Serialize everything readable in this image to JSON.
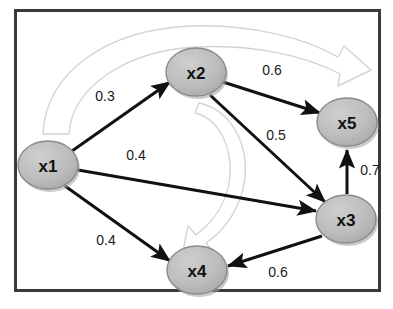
{
  "figure": {
    "type": "directed-weighted-graph",
    "background_color": "#ffffff",
    "border": {
      "color": "#3a3a3a",
      "x": 14,
      "y": 9,
      "width": 367,
      "height": 283,
      "stroke_width": 3
    }
  },
  "style": {
    "node_fill": "#b6b6b6",
    "node_stroke": "#8a8a8a",
    "node_shadow": "#9a9a9a",
    "node_text_color": "#111111",
    "edge_color": "#111111",
    "weight_text_color": "#1a1a1a",
    "decor_arrow_stroke": "#d2d2d2",
    "decor_arrow_fill": "#ffffff"
  },
  "nodes": [
    {
      "id": "x1",
      "label": "x1",
      "cx": 48,
      "cy": 165,
      "rx": 30,
      "ry": 24
    },
    {
      "id": "x2",
      "label": "x2",
      "cx": 196,
      "cy": 72,
      "rx": 30,
      "ry": 24
    },
    {
      "id": "x3",
      "label": "x3",
      "cx": 346,
      "cy": 219,
      "rx": 30,
      "ry": 24
    },
    {
      "id": "x4",
      "label": "x4",
      "cx": 197,
      "cy": 270,
      "rx": 30,
      "ry": 24
    },
    {
      "id": "x5",
      "label": "x5",
      "cx": 347,
      "cy": 122,
      "rx": 30,
      "ry": 24
    }
  ],
  "edges": [
    {
      "id": "e-x1-x2",
      "from": "x1",
      "to": "x2",
      "weight": "0.3",
      "x1": 72,
      "y1": 151,
      "x2": 170,
      "y2": 82,
      "label_x": 105,
      "label_y": 96
    },
    {
      "id": "e-x1-x3",
      "from": "x1",
      "to": "x3",
      "weight": "0.4",
      "x1": 78,
      "y1": 170,
      "x2": 316,
      "y2": 211,
      "label_x": 136,
      "label_y": 155
    },
    {
      "id": "e-x1-x4",
      "from": "x1",
      "to": "x4",
      "weight": "0.4",
      "x1": 65,
      "y1": 186,
      "x2": 170,
      "y2": 261,
      "label_x": 106,
      "label_y": 240
    },
    {
      "id": "e-x2-x5",
      "from": "x2",
      "to": "x5",
      "weight": "0.6",
      "x1": 223,
      "y1": 82,
      "x2": 320,
      "y2": 113,
      "label_x": 272,
      "label_y": 70
    },
    {
      "id": "e-x2-x3",
      "from": "x2",
      "to": "x3",
      "weight": "0.5",
      "x1": 210,
      "y1": 95,
      "x2": 325,
      "y2": 202,
      "label_x": 276,
      "label_y": 135
    },
    {
      "id": "e-x3-x5",
      "from": "x3",
      "to": "x5",
      "weight": "0.7",
      "x1": 347,
      "y1": 194,
      "x2": 347,
      "y2": 148,
      "label_x": 370,
      "label_y": 170
    },
    {
      "id": "e-x3-x4",
      "from": "x3",
      "to": "x4",
      "weight": "0.6",
      "x1": 322,
      "y1": 236,
      "x2": 228,
      "y2": 266,
      "label_x": 278,
      "label_y": 272
    }
  ],
  "decorations": [
    {
      "id": "decor-arc-top",
      "shape": "curved-outline-arrow",
      "direction": "left-to-right"
    },
    {
      "id": "decor-arc-center",
      "shape": "curved-outline-arrow",
      "direction": "clockwise-down"
    }
  ]
}
